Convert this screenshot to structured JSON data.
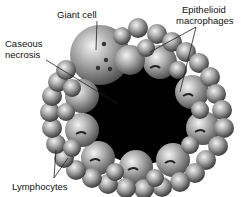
{
  "figure": {
    "type": "granuloma-diagram",
    "labels": {
      "giant_cell": "Giant cell",
      "caseous_necrosis_line1": "Caseous",
      "caseous_necrosis_line2": "necrosis",
      "epithelioid_line1": "Epithelioid",
      "epithelioid_line2": "macrophages",
      "lymphocytes": "Lymphocytes"
    },
    "colors": {
      "necrosis_core": "#000000",
      "cell_light": "#e8e8e8",
      "cell_mid": "#9a9a9a",
      "cell_dark": "#3a3a3a",
      "label_text": "#111111",
      "leader_line": "#222222"
    }
  }
}
